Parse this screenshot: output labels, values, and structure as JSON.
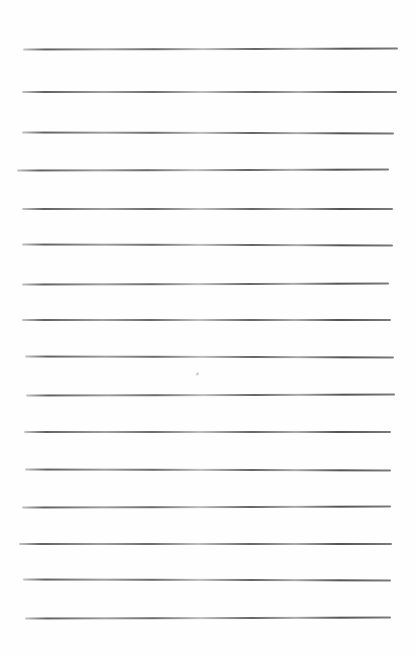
{
  "document": {
    "type": "blank-lined-paper",
    "paper_color": "#fefefe",
    "line_color": "#505050",
    "line_count": 16,
    "lines": [
      {
        "y": 49,
        "x1": 23,
        "x2": 398
      },
      {
        "y": 92,
        "x1": 22,
        "x2": 397
      },
      {
        "y": 133,
        "x1": 22,
        "x2": 394
      },
      {
        "y": 170,
        "x1": 17,
        "x2": 389
      },
      {
        "y": 209,
        "x1": 22,
        "x2": 393
      },
      {
        "y": 245,
        "x1": 22,
        "x2": 393
      },
      {
        "y": 284,
        "x1": 22,
        "x2": 389
      },
      {
        "y": 320,
        "x1": 22,
        "x2": 391
      },
      {
        "y": 357,
        "x1": 25,
        "x2": 394
      },
      {
        "y": 395,
        "x1": 26,
        "x2": 395
      },
      {
        "y": 432,
        "x1": 24,
        "x2": 391
      },
      {
        "y": 470,
        "x1": 25,
        "x2": 391
      },
      {
        "y": 507,
        "x1": 22,
        "x2": 391
      },
      {
        "y": 544,
        "x1": 19,
        "x2": 392
      },
      {
        "y": 580,
        "x1": 23,
        "x2": 391
      },
      {
        "y": 618,
        "x1": 25,
        "x2": 391
      }
    ],
    "marks": [
      {
        "x": 196,
        "y": 373
      }
    ]
  }
}
